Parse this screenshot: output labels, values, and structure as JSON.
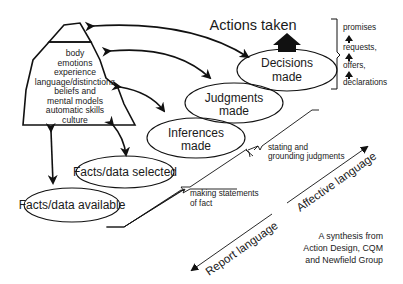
{
  "diagram": {
    "iceberg": {
      "lines": [
        "body",
        "emotions",
        "experience",
        "language/distinctions",
        "beliefs and",
        "mental models",
        "automatic skills",
        "culture"
      ]
    },
    "nodes": {
      "facts_available": "Facts/data available",
      "facts_selected": "Facts/data selected",
      "inferences": [
        "Inferences",
        "made"
      ],
      "judgments": [
        "Judgments",
        "made"
      ],
      "decisions": [
        "Decisions",
        "made"
      ],
      "actions": "Actions taken"
    },
    "speech_acts": [
      "promises",
      "requests,",
      "offers,",
      "declarations"
    ],
    "callouts": {
      "statements_of_fact": [
        "making statements",
        "of fact"
      ],
      "grounding_judgments": [
        "stating and",
        "grounding judgments"
      ]
    },
    "axis": {
      "report": "Report language",
      "affective": "Affective language"
    },
    "credit": [
      "A synthesis from",
      "Action Design, CQM",
      "and Newfield Group"
    ]
  }
}
